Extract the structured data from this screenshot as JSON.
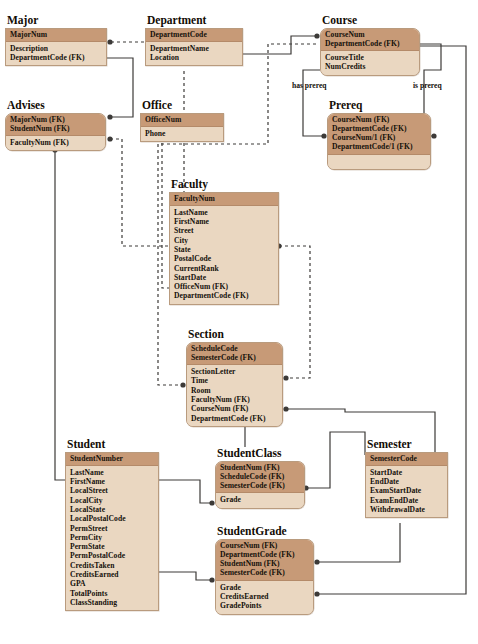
{
  "diagram": {
    "kind": "entity-relationship-diagram",
    "colors": {
      "key_header": "#c79a77",
      "attribute_body": "#ead7c1",
      "border": "#b99b7e",
      "line": "#3c3a38",
      "background": "#ffffff"
    },
    "relationship_labels": [
      {
        "id": "has-prereq",
        "text": "has  prereq",
        "x": 292,
        "y": 86
      },
      {
        "id": "is-prereq",
        "text": "is  prereq",
        "x": 413,
        "y": 86
      }
    ],
    "entities": [
      {
        "id": "major",
        "title": "Major",
        "x": 5,
        "y": 14,
        "w": 102,
        "rounded": false,
        "key_fields": [
          "MajorNum"
        ],
        "attr_fields": [
          "Description",
          "DepartmentCode (FK)"
        ]
      },
      {
        "id": "department",
        "title": "Department",
        "x": 145,
        "y": 14,
        "w": 98,
        "rounded": false,
        "key_fields": [
          "DepartmentCode"
        ],
        "attr_fields": [
          "DepartmentName",
          "Location"
        ]
      },
      {
        "id": "course",
        "title": "Course",
        "x": 320,
        "y": 14,
        "w": 100,
        "rounded": true,
        "key_fields": [
          "CourseNum",
          "DepartmentCode (FK)"
        ],
        "attr_fields": [
          "CourseTitle",
          "NumCredits"
        ]
      },
      {
        "id": "advises",
        "title": "Advises",
        "x": 5,
        "y": 99,
        "w": 101,
        "rounded": true,
        "key_fields": [
          "MajorNum (FK)",
          "StudentNum (FK)"
        ],
        "attr_fields": [
          "FacultyNum (FK)"
        ]
      },
      {
        "id": "office",
        "title": "Office",
        "x": 140,
        "y": 99,
        "w": 84,
        "rounded": false,
        "key_fields": [
          "OfficeNum"
        ],
        "attr_fields": [
          "Phone"
        ]
      },
      {
        "id": "prereq",
        "title": "Prereq",
        "x": 327,
        "y": 99,
        "w": 104,
        "rounded": true,
        "key_fields": [
          "CourseNum (FK)",
          "DepartmentCode (FK)",
          "CourseNum/1 (FK)",
          "DepartmentCode/1 (FK)"
        ],
        "attr_fields": [
          ""
        ]
      },
      {
        "id": "faculty",
        "title": "Faculty",
        "x": 169,
        "y": 178,
        "w": 110,
        "rounded": false,
        "key_fields": [
          "FacultyNum"
        ],
        "attr_fields": [
          "LastName",
          "FirstName",
          "Street",
          "City",
          "State",
          "PostalCode",
          "CurrentRank",
          "StartDate",
          "OfficeNum (FK)",
          "DepartmentCode (FK)"
        ]
      },
      {
        "id": "section",
        "title": "Section",
        "x": 186,
        "y": 328,
        "w": 97,
        "rounded": true,
        "key_fields": [
          "ScheduleCode",
          "SemesterCode (FK)"
        ],
        "attr_fields": [
          "SectionLetter",
          "Time",
          "Room",
          "FacultyNum (FK)",
          "CourseNum (FK)",
          "DepartmentCode (FK)"
        ]
      },
      {
        "id": "student",
        "title": "Student",
        "x": 65,
        "y": 438,
        "w": 94,
        "rounded": false,
        "key_fields": [
          "StudentNumber"
        ],
        "attr_fields": [
          "LastName",
          "FirstName",
          "LocalStreet",
          "LocalCity",
          "LocalState",
          "LocalPostalCode",
          "PermStreet",
          "PermCity",
          "PermState",
          "PermPostalCode",
          "CreditsTaken",
          "CreditsEarned",
          "GPA",
          "TotalPoints",
          "ClassStanding"
        ]
      },
      {
        "id": "studentclass",
        "title": "StudentClass",
        "x": 215,
        "y": 447,
        "w": 90,
        "rounded": true,
        "key_fields": [
          "StudentNum (FK)",
          "ScheduleCode (FK)",
          "SemesterCode (FK)"
        ],
        "attr_fields": [
          "Grade"
        ]
      },
      {
        "id": "semester",
        "title": "Semester",
        "x": 365,
        "y": 438,
        "w": 83,
        "rounded": false,
        "key_fields": [
          "SemesterCode"
        ],
        "attr_fields": [
          "StartDate",
          "EndDate",
          "ExamStartDate",
          "ExamEndDate",
          "WithdrawalDate"
        ]
      },
      {
        "id": "studentgrade",
        "title": "StudentGrade",
        "x": 215,
        "y": 525,
        "w": 99,
        "rounded": true,
        "key_fields": [
          "CourseNum (FK)",
          "DepartmentCode (FK)",
          "StudentNum (FK)",
          "SemesterCode (FK)"
        ],
        "attr_fields": [
          "Grade",
          "CreditsEarned",
          "GradePoints"
        ]
      }
    ]
  }
}
